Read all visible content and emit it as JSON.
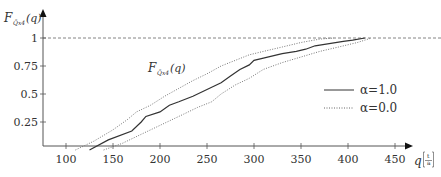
{
  "chart_data": {
    "type": "line",
    "title": "",
    "xlabel": "q",
    "xlabel_unit": "t/a",
    "ylabel": "F̃_{Q̃_{x4}}(q)",
    "inline_label": "F̃_{Q̃_{x4}}(q)",
    "xlim": [
      75,
      470
    ],
    "ylim": [
      0,
      1.08
    ],
    "x_ticks": [
      100,
      150,
      200,
      250,
      300,
      350,
      400,
      450
    ],
    "y_ticks": [
      0.25,
      0.5,
      0.75,
      1
    ],
    "y_tick_labels": [
      "0.25",
      "0.5",
      "0.75",
      "1"
    ],
    "grid": false,
    "reference_line": {
      "y": 1,
      "style": "dashed"
    },
    "legend": {
      "position": "right-middle",
      "entries": [
        "α=1.0",
        "α=0.0"
      ]
    },
    "series": [
      {
        "name": "α=1.0",
        "style": "solid",
        "x": [
          125,
          145,
          170,
          180,
          185,
          200,
          210,
          220,
          235,
          245,
          255,
          265,
          275,
          285,
          295,
          300,
          310,
          330,
          345,
          355,
          365,
          380,
          395,
          405,
          418
        ],
        "y": [
          0.0,
          0.09,
          0.17,
          0.25,
          0.3,
          0.34,
          0.4,
          0.43,
          0.48,
          0.52,
          0.56,
          0.6,
          0.66,
          0.72,
          0.76,
          0.8,
          0.82,
          0.86,
          0.88,
          0.9,
          0.93,
          0.95,
          0.97,
          0.98,
          1.0
        ]
      },
      {
        "name": "α=0.0 (upper)",
        "style": "dotted",
        "x": [
          110,
          130,
          150,
          165,
          175,
          190,
          205,
          220,
          235,
          250,
          265,
          280,
          295,
          310,
          330,
          350,
          370,
          385
        ],
        "y": [
          0.0,
          0.08,
          0.18,
          0.27,
          0.34,
          0.4,
          0.48,
          0.55,
          0.62,
          0.68,
          0.75,
          0.8,
          0.85,
          0.88,
          0.92,
          0.96,
          0.99,
          1.0
        ]
      },
      {
        "name": "α=0.0 (lower)",
        "style": "dotted",
        "x": [
          140,
          160,
          180,
          195,
          210,
          225,
          240,
          255,
          265,
          280,
          295,
          310,
          330,
          350,
          370,
          390,
          410,
          425
        ],
        "y": [
          0.0,
          0.06,
          0.14,
          0.2,
          0.26,
          0.32,
          0.38,
          0.43,
          0.5,
          0.58,
          0.64,
          0.72,
          0.78,
          0.83,
          0.88,
          0.92,
          0.96,
          1.0
        ]
      }
    ]
  },
  "axes": {
    "y_label_main": "F",
    "y_label_sub": "Q̃x4",
    "y_label_arg": "(q)",
    "x_label_main": "q",
    "x_unit_num": "t",
    "x_unit_den": "a"
  },
  "legend": {
    "entries": [
      {
        "label": "α=1.0",
        "style": "solid"
      },
      {
        "label": "α=0.0",
        "style": "dotted"
      }
    ]
  }
}
